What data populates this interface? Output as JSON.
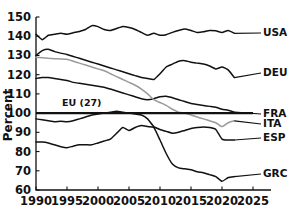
{
  "chart_data": {
    "type": "line",
    "title": "",
    "subtitle": "",
    "xlabel": "",
    "ylabel": "Percent",
    "xlim": [
      1990,
      2025
    ],
    "ylim": [
      60,
      150
    ],
    "xticks": [
      "1990",
      "1995",
      "2000",
      "2005",
      "2010",
      "2015",
      "2020",
      "2025"
    ],
    "yticks": [
      "60",
      "70",
      "80",
      "90",
      "100",
      "110",
      "120",
      "130",
      "140",
      "150"
    ],
    "grid": false,
    "legend_position": "right-inline-labels",
    "annotations": [
      {
        "text": "EU (27)",
        "x": 1994.2,
        "y": 103.5
      }
    ],
    "reference_lines": [
      {
        "label": "EU (27)",
        "value": 100,
        "color": "#111111"
      }
    ],
    "x": [
      1990,
      1991,
      1992,
      1993,
      1994,
      1995,
      1996,
      1997,
      1998,
      1999,
      2000,
      2001,
      2002,
      2003,
      2004,
      2005,
      2006,
      2007,
      2008,
      2009,
      2010,
      2011,
      2012,
      2013,
      2014,
      2015,
      2016,
      2017,
      2018,
      2019,
      2020,
      2021,
      2022
    ],
    "series": [
      {
        "name": "USA",
        "label": "USA",
        "color": "#111111",
        "values": [
          141.0,
          138.2,
          140.5,
          141.0,
          141.5,
          141.0,
          141.8,
          142.5,
          143.5,
          145.5,
          145.0,
          143.5,
          143.0,
          144.0,
          145.0,
          144.5,
          143.5,
          142.0,
          140.5,
          141.5,
          140.5,
          140.8,
          142.0,
          143.0,
          143.8,
          143.0,
          142.0,
          142.3,
          143.0,
          142.8,
          142.0,
          143.0,
          141.5
        ]
      },
      {
        "name": "DEU",
        "label": "DEU",
        "color": "#111111",
        "values": [
          130.0,
          132.5,
          133.2,
          132.0,
          131.2,
          130.5,
          129.5,
          128.5,
          127.5,
          126.5,
          125.5,
          124.5,
          123.5,
          122.5,
          121.5,
          120.5,
          119.5,
          118.5,
          118.0,
          117.5,
          120.5,
          124.0,
          125.5,
          127.0,
          127.3,
          126.5,
          126.0,
          125.5,
          124.5,
          123.0,
          124.0,
          122.5,
          118.5
        ]
      },
      {
        "name": "FRA",
        "label": "FRA",
        "color": "#111111",
        "values": [
          118.0,
          118.5,
          118.5,
          118.0,
          117.5,
          117.0,
          116.0,
          115.5,
          115.0,
          114.5,
          114.0,
          113.5,
          112.5,
          111.5,
          110.5,
          109.5,
          108.5,
          107.5,
          107.0,
          107.5,
          108.5,
          108.8,
          108.0,
          107.0,
          106.0,
          105.0,
          104.5,
          104.0,
          103.5,
          103.0,
          102.0,
          101.5,
          100.5
        ]
      },
      {
        "name": "ITA",
        "label": "ITA",
        "color": "#9a9a9a",
        "values": [
          129.0,
          128.8,
          128.5,
          128.3,
          128.2,
          128.0,
          127.0,
          126.0,
          125.0,
          124.0,
          123.0,
          122.0,
          120.5,
          119.0,
          117.5,
          116.0,
          114.5,
          112.5,
          110.0,
          107.0,
          105.5,
          104.0,
          102.0,
          100.5,
          100.0,
          99.0,
          98.0,
          97.0,
          96.0,
          95.0,
          93.0,
          95.0,
          96.0
        ]
      },
      {
        "name": "ESP",
        "label": "ESP",
        "color": "#111111",
        "values": [
          97.0,
          96.5,
          96.0,
          95.5,
          95.8,
          95.5,
          96.0,
          97.0,
          98.0,
          99.0,
          99.5,
          100.0,
          100.5,
          101.0,
          100.5,
          100.0,
          99.5,
          99.0,
          97.0,
          93.0,
          91.5,
          90.5,
          89.5,
          90.0,
          91.0,
          92.0,
          92.5,
          92.8,
          92.5,
          91.5,
          86.5,
          86.0,
          86.0
        ]
      },
      {
        "name": "GRC",
        "label": "GRC",
        "color": "#111111",
        "values": [
          85.0,
          85.0,
          84.5,
          83.5,
          82.5,
          82.0,
          82.8,
          83.5,
          83.5,
          83.5,
          84.5,
          85.5,
          86.5,
          89.5,
          92.5,
          91.0,
          92.5,
          93.5,
          93.0,
          92.5,
          86.0,
          79.0,
          73.5,
          71.5,
          71.0,
          70.5,
          69.5,
          69.0,
          68.0,
          67.0,
          64.5,
          66.5,
          67.0
        ]
      }
    ]
  },
  "axes": {
    "y_axis_title": "Percent"
  }
}
